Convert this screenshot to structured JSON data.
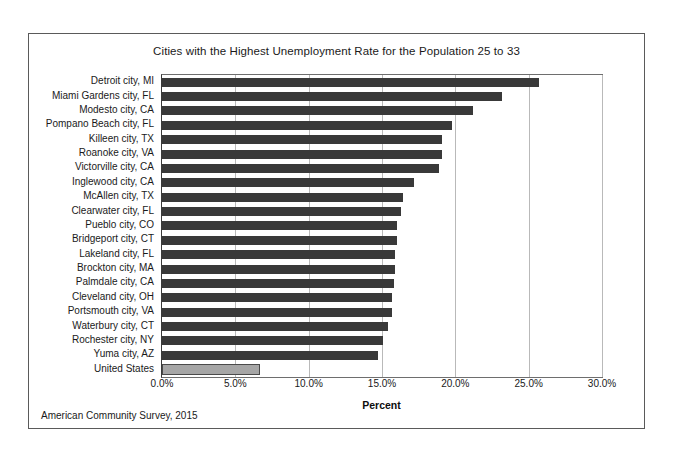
{
  "chart_data": {
    "type": "bar",
    "orientation": "horizontal",
    "title": "Cities with the Highest Unemployment Rate for the Population 25 to 33",
    "xlabel": "Percent",
    "ylabel": "",
    "xlim": [
      0,
      30
    ],
    "xticks": [
      0,
      5,
      10,
      15,
      20,
      25,
      30
    ],
    "xtick_labels": [
      "0.0%",
      "5.0%",
      "10.0%",
      "15.0%",
      "20.0%",
      "25.0%",
      "30.0%"
    ],
    "grid": true,
    "legend": null,
    "source_note": "American Community Survey, 2015",
    "bar_color": "#393939",
    "highlight_color": "#a6a6a6",
    "categories": [
      "Detroit city, MI",
      "Miami Gardens city, FL",
      "Modesto city, CA",
      "Pompano Beach city, FL",
      "Killeen city, TX",
      "Roanoke city, VA",
      "Victorville city, CA",
      "Inglewood city, CA",
      "McAllen city, TX",
      "Clearwater city, FL",
      "Pueblo city, CO",
      "Bridgeport city, CT",
      "Lakeland city, FL",
      "Brockton city, MA",
      "Palmdale city, CA",
      "Cleveland city, OH",
      "Portsmouth city, VA",
      "Waterbury city, CT",
      "Rochester city, NY",
      "Yuma city, AZ",
      "United States"
    ],
    "values": [
      25.7,
      23.2,
      21.2,
      19.8,
      19.1,
      19.1,
      18.9,
      17.2,
      16.4,
      16.3,
      16.0,
      16.0,
      15.9,
      15.9,
      15.8,
      15.7,
      15.7,
      15.4,
      15.1,
      14.7,
      6.7
    ],
    "highlight_index": 20
  }
}
